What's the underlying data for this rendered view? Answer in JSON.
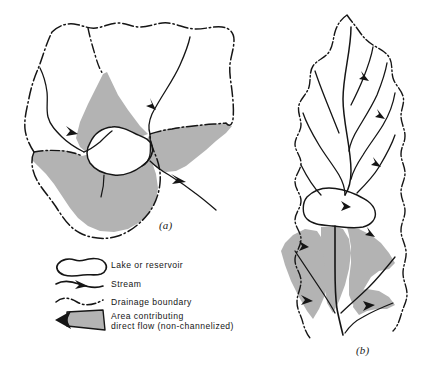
{
  "figure": {
    "type": "map-diagram",
    "background_color": "#ffffff",
    "ink_color": "#151515",
    "shade_color": "#b3b3b3",
    "panels": [
      {
        "id": "a",
        "label": "(a)",
        "name": "compact-basin-map",
        "features": [
          "drainage boundary",
          "internal sub-basin boundaries",
          "lake or reservoir",
          "stream network",
          "shaded direct-flow area",
          "outlet stream with arrow"
        ]
      },
      {
        "id": "b",
        "label": "(b)",
        "name": "elongated-basin-map",
        "features": [
          "drainage boundary",
          "dendritic stream network",
          "lake or reservoir",
          "shaded direct-flow area near outlet"
        ]
      }
    ]
  },
  "legend": {
    "name": "map-legend",
    "items": [
      {
        "symbol": "lake-blob-outline",
        "label": "Lake or reservoir"
      },
      {
        "symbol": "stream-line-with-arrow",
        "label": "Stream"
      },
      {
        "symbol": "dash-dot-boundary-line",
        "label": "Drainage boundary"
      },
      {
        "symbol": "gray-shaded-wedge",
        "label": "Area contributing",
        "label_line2": "direct flow (non-channelized)"
      }
    ]
  }
}
